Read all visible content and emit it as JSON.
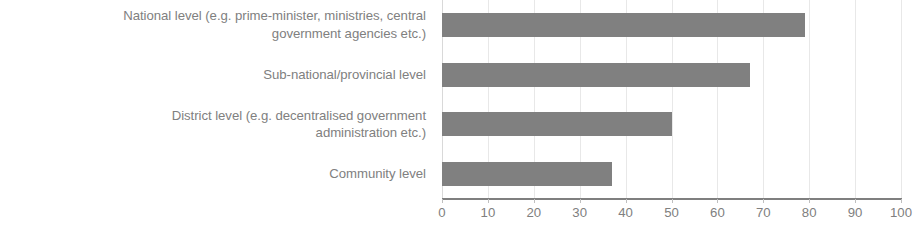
{
  "chart_data": {
    "type": "bar",
    "orientation": "horizontal",
    "title": "",
    "xlabel": "",
    "ylabel": "",
    "categories": [
      "National level (e.g. prime-minister, ministries, central government agencies etc.)",
      "Sub-national/provincial level",
      "District level (e.g. decentralised government administration etc.)",
      "Community level"
    ],
    "category_lines": [
      [
        "National level (e.g. prime-minister, ministries, central",
        "government agencies etc.)"
      ],
      [
        "Sub-national/provincial level"
      ],
      [
        "District level (e.g. decentralised government",
        "administration etc.)"
      ],
      [
        "Community level"
      ]
    ],
    "values": [
      79,
      67,
      50,
      37
    ],
    "xlim": [
      0,
      100
    ],
    "xticks": [
      0,
      10,
      20,
      30,
      40,
      50,
      60,
      70,
      80,
      90,
      100
    ],
    "xtick_labels": [
      "0",
      "10",
      "20",
      "30",
      "40",
      "50",
      "60",
      "70",
      "80",
      "90",
      "100"
    ],
    "grid": true,
    "grid_axis": "x",
    "legend": false,
    "bar_color": "#808080",
    "gridline_color": "#e8e8e8",
    "axis_line_color": "#7f7f7f",
    "label_color": "#808080"
  }
}
